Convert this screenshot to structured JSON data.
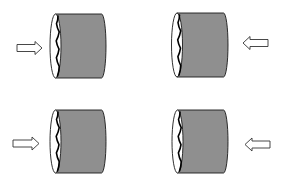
{
  "diagram": {
    "title": "",
    "colors": {
      "background": "#ffffff",
      "cylinder_body": "#8f8f8f",
      "cylinder_outline": "#1a1a1a",
      "end_face": "#ffffff",
      "crack": "#000000",
      "arrow_fill": "#ffffff",
      "arrow_outline": "#333333"
    },
    "panels": [
      {
        "id": "top-left",
        "cylinder": {
          "face_cx": 55.5,
          "face_rx": 5.5,
          "top": 14,
          "bottom": 78,
          "right": 106
        },
        "arrow": {
          "direction": "right",
          "x1": 17,
          "x2": 42,
          "y": 48
        }
      },
      {
        "id": "top-right",
        "cylinder": {
          "face_cx": 177,
          "face_rx": 5.5,
          "top": 13,
          "bottom": 77,
          "right": 228
        },
        "arrow": {
          "direction": "left",
          "x1": 243,
          "x2": 268,
          "y": 43
        }
      },
      {
        "id": "bottom-left",
        "cylinder": {
          "face_cx": 55.5,
          "face_rx": 5.5,
          "top": 110,
          "bottom": 173,
          "right": 106
        },
        "arrow": {
          "direction": "right",
          "x1": 13,
          "x2": 39,
          "y": 143.5
        }
      },
      {
        "id": "bottom-right",
        "cylinder": {
          "face_cx": 177.5,
          "face_rx": 5.5,
          "top": 110,
          "bottom": 173,
          "right": 228
        },
        "arrow": {
          "direction": "left",
          "x1": 245,
          "x2": 270,
          "y": 144.5
        }
      }
    ]
  }
}
